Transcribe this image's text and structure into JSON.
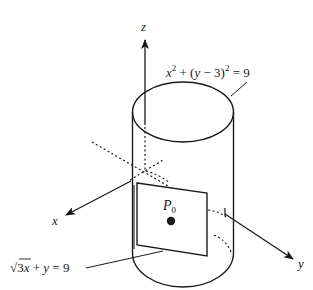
{
  "figure": {
    "axes": {
      "x_label": "x",
      "y_label": "y",
      "z_label": "z"
    },
    "cylinder_equation": {
      "lhs_x": "x",
      "exp1": "2",
      "middle": " + (",
      "var_y": "y",
      "minus3": " − 3)",
      "exp2": "2",
      "rhs": " = 9"
    },
    "plane_equation": {
      "sqrt": "√",
      "radicand": "3",
      "var_x": "x",
      "plus": " + ",
      "var_y": "y",
      "rhs": " = 9"
    },
    "point": {
      "name": "P",
      "subscript": "0"
    },
    "colors": {
      "stroke": "#1a1a1a",
      "background": "#ffffff"
    }
  }
}
